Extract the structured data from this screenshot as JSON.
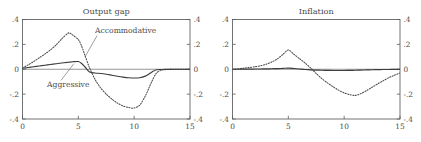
{
  "figure": {
    "width": 421,
    "height": 142,
    "background": "#ffffff",
    "ink_color": "#4a4a4a"
  },
  "chart_data": [
    {
      "type": "line",
      "title": "Output gap",
      "xlabel": "",
      "ylabel": "",
      "xlim": [
        0,
        15
      ],
      "ylim": [
        -0.4,
        0.4
      ],
      "xticks": [
        0,
        5,
        10,
        15
      ],
      "xtick_labels": [
        "0",
        "5",
        "10",
        "15"
      ],
      "yticks": [
        -0.4,
        -0.2,
        0,
        0.2,
        0.4
      ],
      "ytick_labels": [
        "-.4",
        "-.2",
        "0",
        ".2",
        ".4"
      ],
      "ytick_labels_right": [
        "-.4",
        "-.2",
        "0",
        ".2",
        ".4"
      ],
      "grid": false,
      "legend": "inline-annotations",
      "zero_line": true,
      "annotations": [
        {
          "text": "Accommodative",
          "series": "Accommodative",
          "x": 6.5,
          "y": 0.295,
          "leader_to_x": 5.6,
          "leader_to_y": 0.1
        },
        {
          "text": "Aggressive",
          "series": "Aggressive",
          "x": 2.2,
          "y": -0.145,
          "leader_to_x": 4.6,
          "leader_to_y": 0.045
        }
      ],
      "x": [
        0,
        0.5,
        1,
        1.5,
        2,
        2.5,
        3,
        3.5,
        4,
        4.2,
        4.5,
        5,
        5.3,
        5.6,
        6,
        6.5,
        7,
        7.5,
        8,
        8.5,
        9,
        9.5,
        10,
        10.5,
        11,
        11.3,
        11.6,
        12,
        12.5,
        13,
        13.5,
        14,
        14.5,
        15
      ],
      "series": [
        {
          "name": "Accommodative",
          "style": "dotted",
          "values": [
            0.012,
            0.035,
            0.062,
            0.092,
            0.122,
            0.155,
            0.195,
            0.243,
            0.285,
            0.292,
            0.275,
            0.238,
            0.185,
            0.11,
            0.012,
            -0.082,
            -0.15,
            -0.2,
            -0.24,
            -0.272,
            -0.295,
            -0.308,
            -0.312,
            -0.288,
            -0.215,
            -0.155,
            -0.095,
            -0.03,
            -0.006,
            -0.002,
            0.0,
            0.0,
            0.0,
            0.0
          ]
        },
        {
          "name": "Aggressive",
          "style": "solid",
          "values": [
            0.008,
            0.014,
            0.02,
            0.026,
            0.032,
            0.038,
            0.044,
            0.05,
            0.055,
            0.057,
            0.06,
            0.062,
            0.046,
            0.018,
            -0.022,
            -0.03,
            -0.034,
            -0.04,
            -0.048,
            -0.056,
            -0.063,
            -0.068,
            -0.07,
            -0.068,
            -0.055,
            -0.04,
            -0.022,
            -0.004,
            -0.002,
            -0.001,
            0.0,
            0.0,
            0.0,
            0.0
          ]
        }
      ]
    },
    {
      "type": "line",
      "title": "Inflation",
      "xlabel": "",
      "ylabel": "",
      "xlim": [
        0,
        15
      ],
      "ylim": [
        -0.4,
        0.4
      ],
      "xticks": [
        0,
        5,
        10,
        15
      ],
      "xtick_labels": [
        "0",
        "5",
        "10",
        "15"
      ],
      "yticks": [
        -0.4,
        -0.2,
        0,
        0.2,
        0.4
      ],
      "ytick_labels": [
        "-.4",
        "-.2",
        "0",
        ".2",
        ".4"
      ],
      "ytick_labels_right": [
        "-.4",
        "-.2",
        "0",
        ".2",
        ".4"
      ],
      "grid": false,
      "legend": "none",
      "zero_line": true,
      "annotations": [],
      "x": [
        0,
        0.5,
        1,
        1.5,
        2,
        2.5,
        3,
        3.5,
        4,
        4.5,
        5,
        5.5,
        6,
        6.5,
        7,
        7.5,
        8,
        8.5,
        9,
        9.5,
        10,
        10.5,
        11,
        11.5,
        12,
        12.5,
        13,
        13.5,
        14,
        14.5,
        15
      ],
      "series": [
        {
          "name": "Accommodative",
          "style": "dotted",
          "values": [
            0.0,
            0.004,
            0.009,
            0.014,
            0.02,
            0.028,
            0.04,
            0.058,
            0.082,
            0.118,
            0.155,
            0.12,
            0.085,
            0.05,
            0.01,
            -0.035,
            -0.075,
            -0.11,
            -0.14,
            -0.168,
            -0.19,
            -0.204,
            -0.21,
            -0.196,
            -0.172,
            -0.145,
            -0.118,
            -0.092,
            -0.068,
            -0.048,
            -0.03
          ]
        },
        {
          "name": "Aggressive",
          "style": "solid",
          "values": [
            0.0,
            0.0,
            0.001,
            0.001,
            0.002,
            0.002,
            0.003,
            0.004,
            0.005,
            0.007,
            0.009,
            0.006,
            0.002,
            -0.002,
            -0.005,
            -0.007,
            -0.008,
            -0.009,
            -0.01,
            -0.01,
            -0.01,
            -0.009,
            -0.008,
            -0.007,
            -0.005,
            -0.004,
            -0.003,
            -0.002,
            -0.002,
            -0.001,
            -0.001
          ]
        }
      ]
    }
  ]
}
